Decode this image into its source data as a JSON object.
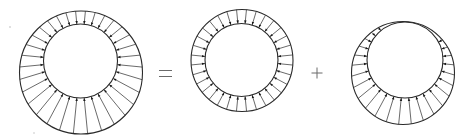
{
  "diagram": {
    "operators": [
      "=",
      "+"
    ],
    "colors": {
      "stroke": "#2a2a2a",
      "operator": "#6a6a6a",
      "background": "#ffffff"
    },
    "panels": [
      {
        "id": "total",
        "label": "non-uniform (eccentric) loading",
        "outer": {
          "cx": 81,
          "cy": 72.5,
          "r": 61.5
        },
        "inner": {
          "cx": 80.5,
          "cy": 61,
          "r": 37
        },
        "arrow_count": 32
      },
      {
        "id": "uniform",
        "label": "uniform loading",
        "outer": {
          "cx": 242,
          "cy": 60.5,
          "r": 51
        },
        "inner": {
          "cx": 241.5,
          "cy": 60,
          "r": 36.5
        },
        "arrow_count": 32
      },
      {
        "id": "eccentric",
        "label": "offset loading",
        "outer": {
          "cx": 403,
          "cy": 73,
          "r": 51.5
        },
        "inner": {
          "cx": 405,
          "cy": 60,
          "r": 38
        },
        "arrow_count": 32,
        "min_gap": 3
      }
    ],
    "equals": {
      "x1": 159,
      "x2": 172,
      "y1": 70.5,
      "y2": 76.5
    },
    "plus": {
      "cx": 317,
      "cy": 73,
      "size": 5.5
    }
  }
}
